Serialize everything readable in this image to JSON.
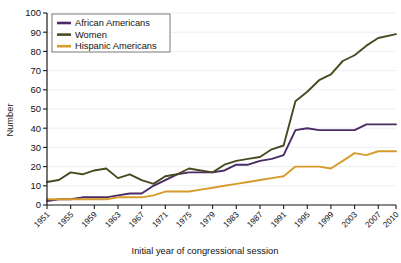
{
  "chart_data": {
    "type": "line",
    "title": "",
    "xlabel": "Initial year of congressional session",
    "ylabel": "Number",
    "xlim": [
      1951,
      2010
    ],
    "ylim": [
      0,
      100
    ],
    "grid": true,
    "legend_position": "top-left",
    "x": [
      1951,
      1953,
      1955,
      1957,
      1959,
      1961,
      1963,
      1965,
      1967,
      1969,
      1971,
      1973,
      1975,
      1977,
      1979,
      1981,
      1983,
      1985,
      1987,
      1989,
      1991,
      1993,
      1995,
      1997,
      1999,
      2001,
      2003,
      2005,
      2007,
      2010
    ],
    "xtick_labels": [
      "1951",
      "1955",
      "1959",
      "1963",
      "1967",
      "1971",
      "1975",
      "1979",
      "1983",
      "1987",
      "1991",
      "1995",
      "1999",
      "2003",
      "2007",
      "2010"
    ],
    "ytick_labels": [
      "0",
      "10",
      "20",
      "30",
      "40",
      "50",
      "60",
      "70",
      "80",
      "90",
      "100"
    ],
    "series": [
      {
        "name": "African Americans",
        "color": "#4a2b63",
        "values": [
          2,
          3,
          3,
          4,
          4,
          4,
          5,
          6,
          6,
          10,
          13,
          16,
          17,
          17,
          17,
          18,
          21,
          21,
          23,
          24,
          26,
          39,
          40,
          39,
          39,
          39,
          39,
          42,
          42,
          42
        ]
      },
      {
        "name": "Women",
        "color": "#4a4a22",
        "values": [
          12,
          13,
          17,
          16,
          18,
          19,
          14,
          16,
          13,
          11,
          15,
          16,
          19,
          18,
          17,
          21,
          23,
          24,
          25,
          29,
          31,
          54,
          59,
          65,
          68,
          75,
          78,
          83,
          87,
          89
        ]
      },
      {
        "name": "Hispanic Americans",
        "color": "#d79b2b",
        "values": [
          3,
          3,
          3,
          3,
          3,
          3,
          4,
          4,
          4,
          5,
          7,
          7,
          7,
          8,
          9,
          10,
          11,
          12,
          13,
          14,
          15,
          20,
          20,
          20,
          19,
          23,
          27,
          26,
          28,
          28
        ]
      }
    ]
  },
  "legend": {
    "items": [
      {
        "label": "African Americans"
      },
      {
        "label": "Women"
      },
      {
        "label": "Hispanic Americans"
      }
    ]
  },
  "axes": {
    "y_title": "Number",
    "x_title": "Initial year of congressional session"
  }
}
